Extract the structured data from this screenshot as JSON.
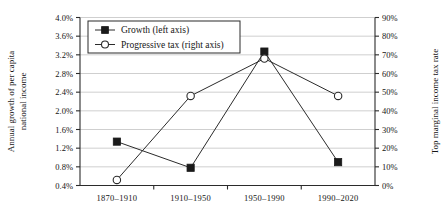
{
  "chart_data": {
    "type": "line",
    "title": "",
    "categories": [
      "1870–1910",
      "1910–1950",
      "1950–1990",
      "1990–2020"
    ],
    "series": [
      {
        "name": "Growth (left axis)",
        "axis": "left",
        "marker": "filled-square",
        "values": [
          1.34,
          0.78,
          3.27,
          0.9
        ],
        "unit": "%"
      },
      {
        "name": "Progressive tax (right axis)",
        "axis": "right",
        "marker": "open-circle",
        "values": [
          3,
          48,
          68,
          48
        ],
        "unit": "%"
      }
    ],
    "ylabel": "Annual growth of per capita national income",
    "ylabel_lines": [
      "Annual growth of per capita",
      "national income"
    ],
    "y2label": "Top marginal income tax rate",
    "xlabel": "",
    "ylim": [
      0.4,
      4.0
    ],
    "y2lim": [
      0,
      90
    ],
    "yticks": [
      "0.4%",
      "0.8%",
      "1.2%",
      "1.6%",
      "2.0%",
      "2.4%",
      "2.8%",
      "3.2%",
      "3.6%",
      "4.0%"
    ],
    "ytick_values": [
      0.4,
      0.8,
      1.2,
      1.6,
      2.0,
      2.4,
      2.8,
      3.2,
      3.6,
      4.0
    ],
    "y2ticks": [
      "0%",
      "10%",
      "20%",
      "30%",
      "40%",
      "50%",
      "60%",
      "70%",
      "80%",
      "90%"
    ],
    "y2tick_values": [
      0,
      10,
      20,
      30,
      40,
      50,
      60,
      70,
      80,
      90
    ],
    "grid": true,
    "grid_axis": "y",
    "legend_position": "top-left",
    "legend": [
      "Growth (left axis)",
      "Progressive tax (right axis)"
    ],
    "colors": {
      "line": "#2b2b2b",
      "grid": "#c9c9c9",
      "axis": "#2b2b2b",
      "marker_fill": "#1a1a1a",
      "marker_open_fill": "#ffffff",
      "background": "#ffffff",
      "text": "#151515"
    }
  }
}
